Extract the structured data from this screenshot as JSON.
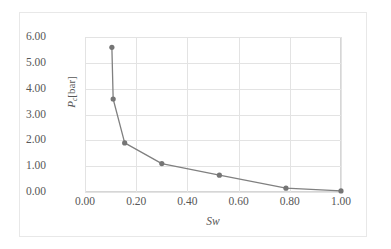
{
  "chart_data": {
    "type": "line",
    "title": "",
    "subtitle": "",
    "xlabel": "Sw",
    "ylabel": "Pc [bar]",
    "ylabel_symbol": "P",
    "ylabel_subscript": "c",
    "ylabel_unit": "[bar]",
    "xlim": [
      0.0,
      1.0
    ],
    "ylim": [
      0.0,
      6.0
    ],
    "grid": true,
    "legend": null,
    "legend_position": "none",
    "marker": "circle",
    "line_color": "#808080",
    "marker_color": "#757575",
    "grid_color": "#e3e3e3",
    "axis_color": "#d6d6d6",
    "text_color": "#575757",
    "xticks": [
      "0.00",
      "0.20",
      "0.40",
      "0.60",
      "0.80",
      "1.00"
    ],
    "xtick_values": [
      0.0,
      0.2,
      0.4,
      0.6,
      0.8,
      1.0
    ],
    "yticks": [
      "0.00",
      "1.00",
      "2.00",
      "3.00",
      "4.00",
      "5.00",
      "6.00"
    ],
    "ytick_values": [
      0.0,
      1.0,
      2.0,
      3.0,
      4.0,
      5.0,
      6.0
    ],
    "series": [
      {
        "name": "Capillary pressure curve",
        "x": [
          0.105,
          0.11,
          0.155,
          0.3,
          0.525,
          0.785,
          1.0
        ],
        "y": [
          5.6,
          3.6,
          1.9,
          1.1,
          0.65,
          0.15,
          0.04
        ]
      }
    ],
    "points": [
      {
        "Sw": 0.105,
        "Pc": 5.6
      },
      {
        "Sw": 0.11,
        "Pc": 3.6
      },
      {
        "Sw": 0.155,
        "Pc": 1.9
      },
      {
        "Sw": 0.3,
        "Pc": 1.1
      },
      {
        "Sw": 0.525,
        "Pc": 0.65
      },
      {
        "Sw": 0.785,
        "Pc": 0.15
      },
      {
        "Sw": 1.0,
        "Pc": 0.04
      }
    ]
  }
}
